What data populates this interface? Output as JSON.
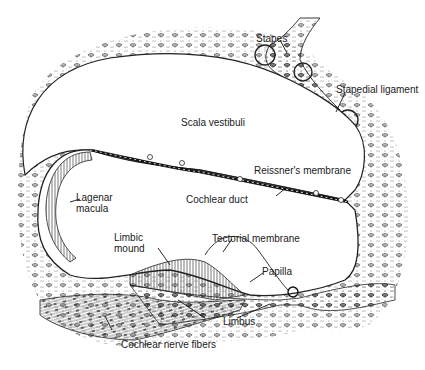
{
  "diagram": {
    "colors": {
      "ink": "#1a1a1a",
      "tissue": "#d8d8d8",
      "background": "#ffffff"
    },
    "labels": [
      {
        "id": "stapes",
        "text": "Stapes"
      },
      {
        "id": "stapedial-ligament",
        "text": "Stapedial ligament"
      },
      {
        "id": "scala-vestibuli",
        "text": "Scala vestibuli"
      },
      {
        "id": "reissners-membrane",
        "text": "Reissner's membrane"
      },
      {
        "id": "lagenar-macula",
        "text": "Lagenar\nmacula"
      },
      {
        "id": "cochlear-duct",
        "text": "Cochlear duct"
      },
      {
        "id": "limbic-mound",
        "text": "Limbic\nmound"
      },
      {
        "id": "tectorial-membrane",
        "text": "Tectorial membrane"
      },
      {
        "id": "papilla",
        "text": "Papilla"
      },
      {
        "id": "limbus",
        "text": "Limbus"
      },
      {
        "id": "cochlear-nerve-fibers",
        "text": "Cochlear nerve fibers"
      }
    ]
  }
}
